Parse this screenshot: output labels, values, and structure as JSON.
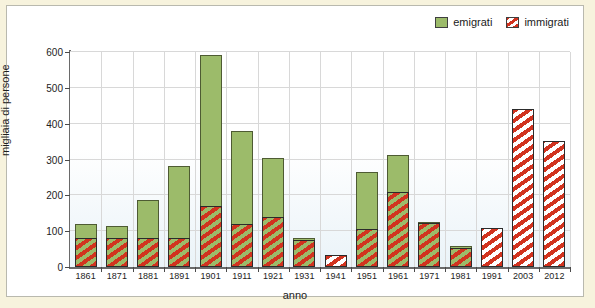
{
  "legend": {
    "position": "top-right",
    "entries": [
      {
        "label": "emigrati",
        "swatch": "green-swatch-icon",
        "color": "#9cbb6a"
      },
      {
        "label": "immigrati",
        "swatch": "red-striped-swatch-icon",
        "color": "#d1331f"
      }
    ]
  },
  "chart_data": {
    "type": "bar",
    "title": "",
    "subtitle": "",
    "xlabel": "anno",
    "ylabel": "migliaia di persone",
    "ylim": [
      0,
      600
    ],
    "yticks": [
      0,
      100,
      200,
      300,
      400,
      500,
      600
    ],
    "grid": true,
    "stacked": true,
    "note": "Overlapping bars: 'immigrati' (red striped) drawn in front of 'emigrati' (green) from the baseline; values are totals from 0.",
    "categories": [
      "1861",
      "1871",
      "1881",
      "1891",
      "1901",
      "1911",
      "1921",
      "1931",
      "1941",
      "1951",
      "1961",
      "1971",
      "1981",
      "1991",
      "2003",
      "2012"
    ],
    "series": [
      {
        "name": "emigrati",
        "color": "#9cbb6a",
        "values": [
          120,
          115,
          186,
          281,
          591,
          380,
          303,
          82,
          6,
          266,
          312,
          126,
          60,
          57,
          50,
          106
        ]
      },
      {
        "name": "immigrati",
        "color": "#d1331f",
        "values": [
          81,
          81,
          81,
          81,
          170,
          121,
          140,
          75,
          34,
          107,
          210,
          123,
          54,
          110,
          440,
          352
        ]
      }
    ]
  }
}
